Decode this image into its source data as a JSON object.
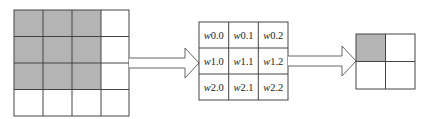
{
  "colors": {
    "shaded": "#b4b4b4",
    "line": "#444444",
    "background": "#ffffff"
  },
  "input_grid": {
    "rows": 4,
    "cols": 4,
    "shaded_cells": [
      [
        0,
        0
      ],
      [
        0,
        1
      ],
      [
        0,
        2
      ],
      [
        1,
        0
      ],
      [
        1,
        1
      ],
      [
        1,
        2
      ],
      [
        2,
        0
      ],
      [
        2,
        1
      ],
      [
        2,
        2
      ]
    ]
  },
  "kernel_grid": {
    "rows": 3,
    "cols": 3,
    "cells": [
      [
        "w0.0",
        "w0.1",
        "w0.2"
      ],
      [
        "w1.0",
        "w1.1",
        "w1.2"
      ],
      [
        "w2.0",
        "w2.1",
        "w2.2"
      ]
    ]
  },
  "output_grid": {
    "rows": 2,
    "cols": 2,
    "shaded_cells": [
      [
        0,
        0
      ]
    ]
  },
  "arrows": [
    {
      "from": "input_grid",
      "to": "kernel_grid"
    },
    {
      "from": "kernel_grid",
      "to": "output_grid"
    }
  ]
}
